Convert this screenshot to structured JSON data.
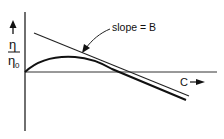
{
  "diagram": {
    "y_axis_label_numerator": "η",
    "y_axis_label_denominator": "η",
    "y_axis_label_subscript": "0",
    "x_axis_label": "C",
    "annotation": "slope = B",
    "elements": [
      {
        "type": "axis",
        "name": "y-axis"
      },
      {
        "type": "axis",
        "name": "x-axis"
      },
      {
        "type": "line",
        "name": "straight-line",
        "description": "descending straight line with slope B"
      },
      {
        "type": "curve",
        "name": "curved-line",
        "description": "curve rising to a maximum then descending parallel to line"
      },
      {
        "type": "arrow",
        "name": "annotation-arrow",
        "points_to": "straight-line"
      }
    ]
  }
}
